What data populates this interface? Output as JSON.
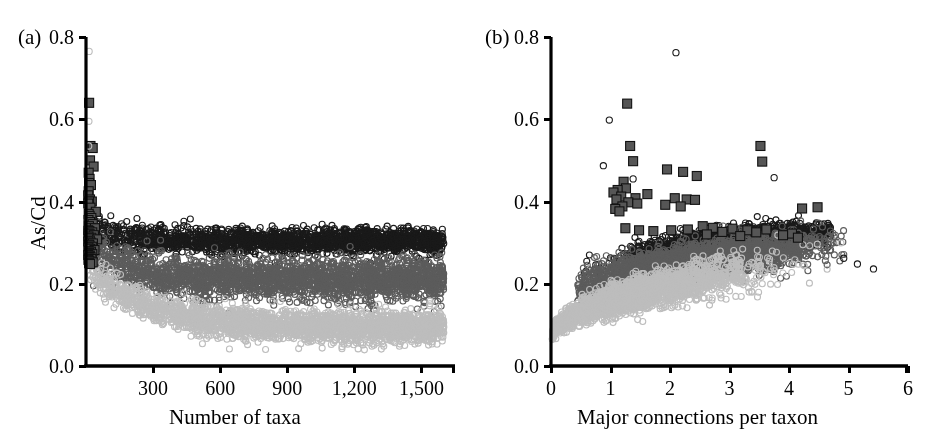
{
  "figure": {
    "width": 935,
    "height": 444,
    "background": "#ffffff",
    "ink": "#000000"
  },
  "series_styles": {
    "black_circles": {
      "color": "#1a1a1a",
      "marker": "open-circle"
    },
    "dark_gray_circles": {
      "color": "#5c5c5c",
      "marker": "open-circle"
    },
    "light_gray_circles": {
      "color": "#bdbdbd",
      "marker": "open-circle"
    },
    "dark_squares": {
      "color": "#565656",
      "edge": "#111111",
      "marker": "filled-square"
    }
  },
  "chart_data": [
    {
      "type": "scatter",
      "panel_label": "(a)",
      "title": "",
      "xlabel": "Number of taxa",
      "ylabel": "As/Cd",
      "xlim": [
        0,
        1650
      ],
      "ylim": [
        0.0,
        0.8
      ],
      "xticks": [
        300,
        600,
        900,
        1200,
        1500
      ],
      "xticklabels": [
        "300",
        "600",
        "900",
        "1,200",
        "1,500"
      ],
      "yticks": [
        0.0,
        0.2,
        0.4,
        0.6,
        0.8
      ],
      "yticklabels": [
        "0.0",
        "0.2",
        "0.4",
        "0.6",
        "0.8"
      ],
      "grid": false,
      "legend": "none",
      "series": [
        {
          "name": "black_circles",
          "style": "black_circles",
          "n": 1800,
          "description": "Upper band of open black circles; declines slightly with taxa count then flat near 0.30",
          "model": {
            "kind": "band-decay",
            "x_min": 10,
            "x_max": 1600,
            "y_start": 0.34,
            "y_plateau": 0.305,
            "decay_x": 120,
            "spread_start": 0.055,
            "spread_plateau": 0.028,
            "x_density": "uniform-heavy-right"
          }
        },
        {
          "name": "dark_gray_circles",
          "style": "dark_gray_circles",
          "n": 2400,
          "description": "Middle band of open dark-gray circles centered near 0.21, widening to 0.14-0.27",
          "model": {
            "kind": "band-decay",
            "x_min": 10,
            "x_max": 1600,
            "y_start": 0.3,
            "y_plateau": 0.212,
            "decay_x": 150,
            "spread_start": 0.05,
            "spread_plateau": 0.045,
            "x_density": "uniform-heavy-right"
          }
        },
        {
          "name": "light_gray_circles",
          "style": "light_gray_circles",
          "n": 2400,
          "description": "Lower band of open light-gray circles decaying from 0.22 to about 0.09",
          "model": {
            "kind": "band-decay",
            "x_min": 10,
            "x_max": 1600,
            "y_start": 0.245,
            "y_plateau": 0.093,
            "decay_x": 260,
            "spread_start": 0.035,
            "spread_plateau": 0.035,
            "x_density": "uniform-heavy-right"
          }
        },
        {
          "name": "dark_squares",
          "style": "dark_squares",
          "n": 60,
          "description": "Filled dark-gray squares clustered at very low taxa counts with high As/Cd",
          "points": [
            [
              14,
              0.64
            ],
            [
              20,
              0.535
            ],
            [
              30,
              0.53
            ],
            [
              18,
              0.5
            ],
            [
              34,
              0.485
            ],
            [
              12,
              0.47
            ],
            [
              16,
              0.455
            ],
            [
              14,
              0.445
            ],
            [
              22,
              0.44
            ],
            [
              12,
              0.425
            ],
            [
              10,
              0.415
            ],
            [
              18,
              0.405
            ],
            [
              26,
              0.4
            ],
            [
              14,
              0.4
            ],
            [
              10,
              0.395
            ],
            [
              20,
              0.385
            ],
            [
              44,
              0.375
            ],
            [
              12,
              0.37
            ],
            [
              16,
              0.365
            ],
            [
              24,
              0.36
            ],
            [
              11,
              0.355
            ],
            [
              18,
              0.35
            ],
            [
              30,
              0.345
            ],
            [
              13,
              0.34
            ],
            [
              22,
              0.335
            ],
            [
              40,
              0.335
            ],
            [
              10,
              0.33
            ],
            [
              15,
              0.328
            ],
            [
              28,
              0.325
            ],
            [
              12,
              0.322
            ],
            [
              19,
              0.32
            ],
            [
              35,
              0.318
            ],
            [
              11,
              0.315
            ],
            [
              24,
              0.312
            ],
            [
              14,
              0.31
            ],
            [
              50,
              0.308
            ],
            [
              17,
              0.305
            ],
            [
              10,
              0.303
            ],
            [
              21,
              0.3
            ],
            [
              31,
              0.298
            ],
            [
              13,
              0.295
            ],
            [
              16,
              0.293
            ],
            [
              26,
              0.29
            ],
            [
              11,
              0.288
            ],
            [
              19,
              0.285
            ],
            [
              38,
              0.282
            ],
            [
              12,
              0.28
            ],
            [
              22,
              0.278
            ],
            [
              15,
              0.275
            ],
            [
              28,
              0.272
            ],
            [
              10,
              0.27
            ],
            [
              17,
              0.268
            ],
            [
              20,
              0.265
            ],
            [
              13,
              0.262
            ],
            [
              24,
              0.26
            ],
            [
              11,
              0.258
            ],
            [
              16,
              0.255
            ],
            [
              30,
              0.252
            ],
            [
              14,
              0.25
            ],
            [
              18,
              0.248
            ]
          ]
        },
        {
          "name": "outlier_circles",
          "style": "light_gray_circles",
          "n": 3,
          "description": "A few isolated high open circles near the y-axis",
          "points": [
            [
              14,
              0.765
            ],
            [
              13,
              0.595
            ],
            [
              12,
              0.535
            ]
          ]
        }
      ]
    },
    {
      "type": "scatter",
      "panel_label": "(b)",
      "title": "",
      "xlabel": "Major connections per taxon",
      "ylabel": "As/Cd",
      "xlim": [
        0,
        6
      ],
      "ylim": [
        0.0,
        0.8
      ],
      "xticks": [
        0,
        1,
        2,
        3,
        4,
        5,
        6
      ],
      "xticklabels": [
        "0",
        "1",
        "2",
        "3",
        "4",
        "5",
        "6"
      ],
      "yticks": [
        0.0,
        0.2,
        0.4,
        0.6,
        0.8
      ],
      "yticklabels": [
        "0.0",
        "0.2",
        "0.4",
        "0.6",
        "0.8"
      ],
      "grid": false,
      "legend": "none",
      "series": [
        {
          "name": "black_circles",
          "style": "black_circles",
          "n": 1800,
          "description": "Open black circles rising from 0.20 at 0.8 connections to 0.33 near 4 connections",
          "model": {
            "kind": "trend",
            "x_min": 0.55,
            "x_max": 4.7,
            "y_at_xmin": 0.225,
            "y_at_xmax": 0.325,
            "curve": 0.55,
            "spread": 0.028,
            "x_peak": 3.0,
            "x_sigma": 0.85
          }
        },
        {
          "name": "dark_gray_circles",
          "style": "dark_gray_circles",
          "n": 2400,
          "description": "Open dark-gray circles forming the broad rising ridge from 0.18 to 0.30",
          "model": {
            "kind": "trend",
            "x_min": 0.45,
            "x_max": 5.0,
            "y_at_xmin": 0.185,
            "y_at_xmax": 0.3,
            "curve": 0.6,
            "spread": 0.035,
            "x_peak": 2.3,
            "x_sigma": 1.1
          }
        },
        {
          "name": "light_gray_circles",
          "style": "light_gray_circles",
          "n": 2400,
          "description": "Light-gray circles forming a plume from the origin (0, 0.07) fanning upward to the right",
          "model": {
            "kind": "plume",
            "x_min": 0.02,
            "x_max": 4.9,
            "y_at_xmin": 0.07,
            "y_at_xmax": 0.265,
            "curve": 0.5,
            "spread_min": 0.012,
            "spread_max": 0.05,
            "x_peak": 0.9,
            "x_sigma": 1.2
          }
        },
        {
          "name": "dark_squares",
          "style": "dark_squares",
          "n": 45,
          "description": "Filled dark-gray squares, mostly between 1 and 4.5 connections with high As/Cd",
          "points": [
            [
              1.28,
              0.638
            ],
            [
              1.33,
              0.535
            ],
            [
              3.52,
              0.535
            ],
            [
              1.38,
              0.498
            ],
            [
              3.55,
              0.497
            ],
            [
              1.95,
              0.478
            ],
            [
              2.22,
              0.472
            ],
            [
              2.45,
              0.462
            ],
            [
              1.22,
              0.448
            ],
            [
              1.62,
              0.418
            ],
            [
              1.26,
              0.432
            ],
            [
              1.12,
              0.428
            ],
            [
              1.05,
              0.422
            ],
            [
              1.18,
              0.412
            ],
            [
              1.42,
              0.408
            ],
            [
              2.08,
              0.408
            ],
            [
              2.28,
              0.405
            ],
            [
              2.42,
              0.404
            ],
            [
              1.92,
              0.392
            ],
            [
              2.18,
              0.388
            ],
            [
              4.22,
              0.383
            ],
            [
              4.48,
              0.386
            ],
            [
              1.1,
              0.405
            ],
            [
              1.3,
              0.398
            ],
            [
              1.45,
              0.395
            ],
            [
              1.2,
              0.388
            ],
            [
              1.08,
              0.382
            ],
            [
              1.15,
              0.376
            ],
            [
              2.55,
              0.34
            ],
            [
              2.72,
              0.336
            ],
            [
              2.3,
              0.332
            ],
            [
              3.05,
              0.334
            ],
            [
              3.3,
              0.33
            ],
            [
              3.62,
              0.332
            ],
            [
              2.88,
              0.326
            ],
            [
              1.25,
              0.335
            ],
            [
              1.48,
              0.33
            ],
            [
              4.05,
              0.322
            ],
            [
              3.9,
              0.318
            ],
            [
              2.62,
              0.32
            ],
            [
              3.18,
              0.316
            ],
            [
              2.02,
              0.33
            ],
            [
              1.72,
              0.328
            ],
            [
              3.45,
              0.325
            ],
            [
              4.15,
              0.312
            ]
          ]
        },
        {
          "name": "outlier_circles",
          "style": "black_circles",
          "n": 8,
          "description": "Isolated open circles at high As/Cd or far right",
          "points": [
            [
              2.1,
              0.762
            ],
            [
              0.98,
              0.598
            ],
            [
              0.88,
              0.487
            ],
            [
              1.38,
              0.455
            ],
            [
              3.75,
              0.458
            ],
            [
              5.15,
              0.248
            ],
            [
              5.42,
              0.236
            ],
            [
              4.92,
              0.262
            ]
          ]
        }
      ]
    }
  ]
}
